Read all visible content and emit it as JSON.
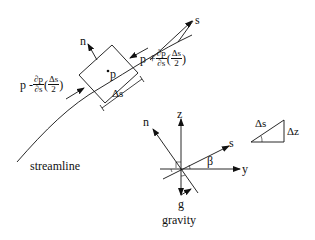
{
  "labels": {
    "s_axis_top": "s",
    "n_top": "n",
    "p_center": "p",
    "delta_s_box": "Δs",
    "streamline": "streamline",
    "gravity": "gravity",
    "n_axes": "n",
    "z_axes": "z",
    "s_axes": "s",
    "y_axes": "y",
    "beta": "β",
    "g": "g",
    "triangle_hyp": "Δs",
    "triangle_side": "Δz"
  },
  "equations": {
    "left": {
      "prefix": "p - ",
      "deriv_num": "∂p",
      "deriv_den": "∂s",
      "paren_open": "(",
      "paren_num": "Δs",
      "paren_den": "2",
      "paren_close": ")"
    },
    "right": {
      "prefix": "p + ",
      "deriv_num": "∂p",
      "deriv_den": "∂s",
      "paren_open": "(",
      "paren_num": "Δs",
      "paren_den": "2",
      "paren_close": ")"
    }
  },
  "colors": {
    "line": "#111111",
    "background": "#ffffff"
  }
}
